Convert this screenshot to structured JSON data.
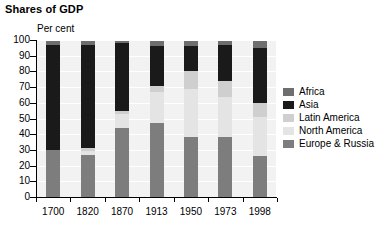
{
  "title": "Shares of GDP",
  "unit_label": "Per cent",
  "legend": {
    "items": [
      {
        "label": "Africa",
        "color": "#6e6e6e"
      },
      {
        "label": "Asia",
        "color": "#1a1a1a"
      },
      {
        "label": "Latin America",
        "color": "#cfcfcf"
      },
      {
        "label": "North America",
        "color": "#e4e4e4"
      },
      {
        "label": "Europe & Russia",
        "color": "#7d7d7d"
      }
    ]
  },
  "axes": {
    "y_ticks": [
      "100",
      "90",
      "80",
      "70",
      "60",
      "50",
      "40",
      "30",
      "20",
      "10",
      "0"
    ],
    "x_ticks": [
      "1700",
      "1820",
      "1870",
      "1913",
      "1950",
      "1973",
      "1998"
    ]
  },
  "chart_data": {
    "type": "bar",
    "stacked": true,
    "title": "Shares of GDP",
    "xlabel": "",
    "ylabel": "Per cent",
    "ylim": [
      0,
      100
    ],
    "ytick_step": 10,
    "grid": true,
    "legend_position": "right",
    "categories": [
      "1700",
      "1820",
      "1870",
      "1913",
      "1950",
      "1973",
      "1998"
    ],
    "series": [
      {
        "name": "Europe & Russia",
        "color": "#7d7d7d",
        "values": [
          30,
          27,
          44,
          47,
          38,
          38,
          26
        ]
      },
      {
        "name": "North America",
        "color": "#e4e4e4",
        "values": [
          0,
          2,
          9,
          20,
          31,
          26,
          25
        ]
      },
      {
        "name": "Latin America",
        "color": "#cfcfcf",
        "values": [
          0,
          2,
          2,
          4,
          11,
          10,
          9
        ]
      },
      {
        "name": "Asia",
        "color": "#1a1a1a",
        "values": [
          67,
          66,
          43,
          25,
          16,
          23,
          35
        ]
      },
      {
        "name": "Africa",
        "color": "#6e6e6e",
        "values": [
          3,
          3,
          2,
          4,
          4,
          3,
          5
        ]
      }
    ]
  }
}
